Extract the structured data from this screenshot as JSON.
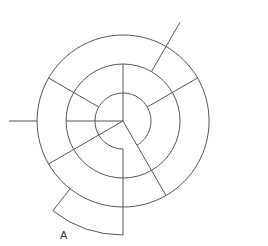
{
  "diagram": {
    "type": "spiral-maze",
    "rings": 4,
    "start_label": "A",
    "line_color": "#555555",
    "background": "#ffffff"
  }
}
